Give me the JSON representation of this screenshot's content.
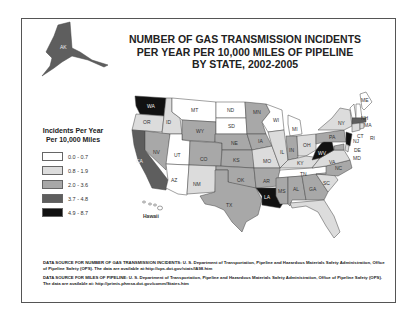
{
  "title": {
    "line1": "NUMBER OF GAS TRANSMISSION INCIDENTS",
    "line2": "PER YEAR PER 10,000 MILES OF PIPELINE",
    "line3": "BY STATE,  2002-2005"
  },
  "legend": {
    "title_line1": "Incidents Per Year",
    "title_line2": "Per 10,000 Miles",
    "items": [
      {
        "label": "0.0 - 0.7",
        "color": "#ffffff"
      },
      {
        "label": "0.8 - 1.9",
        "color": "#dcdcdc"
      },
      {
        "label": "2.0 - 3.6",
        "color": "#a8a8a8"
      },
      {
        "label": "3.7 - 4.8",
        "color": "#5e5e5e"
      },
      {
        "label": "4.9 - 8.7",
        "color": "#111111"
      }
    ]
  },
  "map": {
    "hawaii_label": "Hawaii",
    "states": {
      "AK": "3.7 - 4.8",
      "WA": "4.9 - 8.7",
      "OR": "0.8 - 1.9",
      "CA": "3.7 - 4.8",
      "ID": "0.8 - 1.9",
      "NV": "2.0 - 3.6",
      "MT": "0.0 - 0.7",
      "WY": "2.0 - 3.6",
      "UT": "0.0 - 0.7",
      "AZ": "0.0 - 0.7",
      "CO": "2.0 - 3.6",
      "NM": "0.8 - 1.9",
      "ND": "0.0 - 0.7",
      "SD": "0.0 - 0.7",
      "NE": "2.0 - 3.6",
      "KS": "2.0 - 3.6",
      "OK": "2.0 - 3.6",
      "TX": "2.0 - 3.6",
      "MN": "2.0 - 3.6",
      "IA": "2.0 - 3.6",
      "MO": "0.8 - 1.9",
      "AR": "2.0 - 3.6",
      "LA": "4.9 - 8.7",
      "WI": "0.0 - 0.7",
      "IL": "0.8 - 1.9",
      "MI": "0.0 - 0.7",
      "IN": "2.0 - 3.6",
      "OH": "0.8 - 1.9",
      "KY": "0.8 - 1.9",
      "TN": "0.0 - 0.7",
      "MS": "2.0 - 3.6",
      "AL": "2.0 - 3.6",
      "GA": "2.0 - 3.6",
      "FL": "0.8 - 1.9",
      "SC": "0.8 - 1.9",
      "NC": "2.0 - 3.6",
      "VA": "0.8 - 1.9",
      "WV": "4.9 - 8.7",
      "PA": "2.0 - 3.6",
      "NY": "0.8 - 1.9",
      "NJ": "4.9 - 8.7",
      "DE": "0.8 - 1.9",
      "MD": "2.0 - 3.6",
      "CT": "0.8 - 1.9",
      "MA": "3.7 - 4.8",
      "NH": "0.0 - 0.7",
      "VT": "0.0 - 0.7",
      "ME": "0.0 - 0.7",
      "RI": "0.8 - 1.9",
      "HI": "0.0 - 0.7"
    }
  },
  "sources": {
    "incidents": "DATA SOURCE FOR NUMBER OF GAS TRANSMISSION INCIDENTS: U. S. Department of Transportation, Pipeline and Hazardous Materials Safety Administration, Office of Pipeline Safety (OPS). The data are available at:http://ops.dot.gov/stats/IA98.htm",
    "miles": "DATA SOURCE FOR MILES OF PIPELINE: U. S. Department of Transportation, Pipeline and Hazardous Materials Safety Administration, Office of Pipeline Safety (OPS). The data are available at: http://primis.phmsa.dot.gov/comm/States.htm"
  }
}
